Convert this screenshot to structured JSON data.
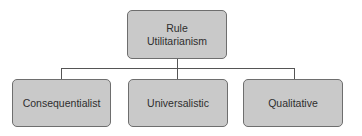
{
  "diagram": {
    "type": "hierarchy",
    "root": {
      "label": "Rule\nUtilitarianism"
    },
    "children": [
      {
        "label": "Consequentialist"
      },
      {
        "label": "Universalistic"
      },
      {
        "label": "Qualitative"
      }
    ],
    "colors": {
      "box_fill": "#c9c9c9",
      "box_border": "#6e6e6e",
      "connector": "#555555",
      "text": "#2e2e2e"
    }
  }
}
